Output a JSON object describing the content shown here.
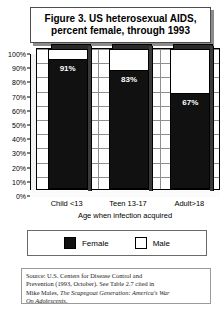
{
  "title": {
    "line1": "Figure 3. US heterosexual AIDS,",
    "line2": "percent female, through 1993"
  },
  "chart_data": {
    "type": "bar",
    "subtype": "stacked-percent-3d",
    "title": "Figure 3. US heterosexual AIDS, percent female, through 1993",
    "xlabel": "Age when infection acquired",
    "ylabel": "",
    "ylim": [
      0,
      100
    ],
    "yticks": [
      "0%",
      "10%",
      "20%",
      "30%",
      "40%",
      "50%",
      "60%",
      "70%",
      "80%",
      "90%",
      "100%"
    ],
    "grid": true,
    "legend_position": "bottom",
    "categories": [
      "Child <13",
      "Teen 13-17",
      "Adult>18"
    ],
    "series": [
      {
        "name": "Female",
        "color": "#111111",
        "values": [
          91,
          83,
          67
        ],
        "labels": [
          "91%",
          "83%",
          "67%"
        ]
      },
      {
        "name": "Male",
        "color": "#ffffff",
        "values": [
          9,
          17,
          33
        ],
        "labels": [
          "",
          "",
          ""
        ]
      }
    ]
  },
  "legend": {
    "items": [
      {
        "label": "Female",
        "swatch": "black"
      },
      {
        "label": "Male",
        "swatch": "white"
      }
    ]
  },
  "source": {
    "line1": "Source: U.S. Centers for Disease Control and",
    "line2": "Prevention (1993, October). See Table 2.7 cited in",
    "line3_prefix": "Mike Males, ",
    "line3_italic": "The Scapegoat Generation: America's War",
    "line4_italic": "On Adolescents",
    "line4_suffix": "."
  }
}
